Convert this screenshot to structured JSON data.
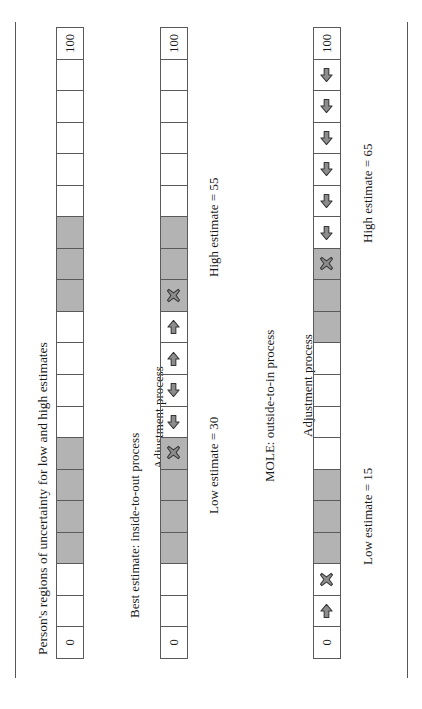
{
  "figure": {
    "title": "Person's regions of uncertainty for low and high estimates",
    "scale_min_label": "0",
    "scale_max_label": "100",
    "cell_count": 20,
    "shade_color": "#b3b3b3",
    "line_color": "#5a5a5a"
  },
  "panels": [
    {
      "id": "panel-uncertainty",
      "caption": "",
      "bar": {
        "name": "uncertainty-regions-bar",
        "min_label": "0",
        "max_label": "100",
        "cells": [
          {
            "index": 0,
            "value_range": "0-5",
            "shaded": false,
            "icon": null
          },
          {
            "index": 1,
            "value_range": "5-10",
            "shaded": false,
            "icon": null
          },
          {
            "index": 2,
            "value_range": "10-15",
            "shaded": false,
            "icon": null
          },
          {
            "index": 3,
            "value_range": "15-20",
            "shaded": true,
            "icon": null
          },
          {
            "index": 4,
            "value_range": "20-25",
            "shaded": true,
            "icon": null
          },
          {
            "index": 5,
            "value_range": "25-30",
            "shaded": true,
            "icon": null
          },
          {
            "index": 6,
            "value_range": "30-35",
            "shaded": true,
            "icon": null
          },
          {
            "index": 7,
            "value_range": "35-40",
            "shaded": false,
            "icon": null
          },
          {
            "index": 8,
            "value_range": "40-45",
            "shaded": false,
            "icon": null
          },
          {
            "index": 9,
            "value_range": "45-50",
            "shaded": false,
            "icon": null
          },
          {
            "index": 10,
            "value_range": "50-55",
            "shaded": false,
            "icon": null
          },
          {
            "index": 11,
            "value_range": "55-60",
            "shaded": true,
            "icon": null
          },
          {
            "index": 12,
            "value_range": "60-65",
            "shaded": true,
            "icon": null
          },
          {
            "index": 13,
            "value_range": "65-70",
            "shaded": true,
            "icon": null
          },
          {
            "index": 14,
            "value_range": "70-75",
            "shaded": false,
            "icon": null
          },
          {
            "index": 15,
            "value_range": "75-80",
            "shaded": false,
            "icon": null
          },
          {
            "index": 16,
            "value_range": "80-85",
            "shaded": false,
            "icon": null
          },
          {
            "index": 17,
            "value_range": "85-90",
            "shaded": false,
            "icon": null
          },
          {
            "index": 18,
            "value_range": "90-95",
            "shaded": false,
            "icon": null
          },
          {
            "index": 19,
            "value_range": "95-100",
            "shaded": false,
            "icon": null
          }
        ]
      },
      "labels": []
    },
    {
      "id": "panel-inside-to-out",
      "caption": "Best estimate: inside-to-out process",
      "process_label": "Adjustment process",
      "bar": {
        "name": "inside-to-out-bar",
        "min_label": "0",
        "max_label": "100",
        "cells": [
          {
            "index": 0,
            "value_range": "0-5",
            "shaded": false,
            "icon": null
          },
          {
            "index": 1,
            "value_range": "5-10",
            "shaded": false,
            "icon": null
          },
          {
            "index": 2,
            "value_range": "10-15",
            "shaded": false,
            "icon": null
          },
          {
            "index": 3,
            "value_range": "15-20",
            "shaded": true,
            "icon": null
          },
          {
            "index": 4,
            "value_range": "20-25",
            "shaded": true,
            "icon": null
          },
          {
            "index": 5,
            "value_range": "25-30",
            "shaded": true,
            "icon": null
          },
          {
            "index": 6,
            "value_range": "30-35",
            "shaded": true,
            "icon": "cross-marker-icon"
          },
          {
            "index": 7,
            "value_range": "35-40",
            "shaded": false,
            "icon": "arrow-down-icon"
          },
          {
            "index": 8,
            "value_range": "40-45",
            "shaded": false,
            "icon": "arrow-down-icon"
          },
          {
            "index": 9,
            "value_range": "45-50",
            "shaded": false,
            "icon": "arrow-up-icon"
          },
          {
            "index": 10,
            "value_range": "50-55",
            "shaded": false,
            "icon": "arrow-up-icon"
          },
          {
            "index": 11,
            "value_range": "55-60",
            "shaded": true,
            "icon": "cross-marker-icon"
          },
          {
            "index": 12,
            "value_range": "60-65",
            "shaded": true,
            "icon": null
          },
          {
            "index": 13,
            "value_range": "65-70",
            "shaded": true,
            "icon": null
          },
          {
            "index": 14,
            "value_range": "70-75",
            "shaded": false,
            "icon": null
          },
          {
            "index": 15,
            "value_range": "75-80",
            "shaded": false,
            "icon": null
          },
          {
            "index": 16,
            "value_range": "80-85",
            "shaded": false,
            "icon": null
          },
          {
            "index": 17,
            "value_range": "85-90",
            "shaded": false,
            "icon": null
          },
          {
            "index": 18,
            "value_range": "90-95",
            "shaded": false,
            "icon": null
          },
          {
            "index": 19,
            "value_range": "95-100",
            "shaded": false,
            "icon": null
          }
        ]
      },
      "low_estimate_label": "Low estimate = 30",
      "high_estimate_label": "High estimate = 55",
      "low_estimate_value": 30,
      "high_estimate_value": 55
    },
    {
      "id": "panel-outside-to-in",
      "caption": "MOLE: outside-to-in process",
      "process_label": "Adjustment process",
      "bar": {
        "name": "outside-to-in-bar",
        "min_label": "0",
        "max_label": "100",
        "cells": [
          {
            "index": 0,
            "value_range": "0-5",
            "shaded": false,
            "icon": "arrow-up-icon"
          },
          {
            "index": 1,
            "value_range": "5-10",
            "shaded": false,
            "icon": "arrow-up-icon"
          },
          {
            "index": 2,
            "value_range": "10-15",
            "shaded": false,
            "icon": "cross-marker-icon"
          },
          {
            "index": 3,
            "value_range": "15-20",
            "shaded": true,
            "icon": null
          },
          {
            "index": 4,
            "value_range": "20-25",
            "shaded": true,
            "icon": null
          },
          {
            "index": 5,
            "value_range": "25-30",
            "shaded": true,
            "icon": null
          },
          {
            "index": 6,
            "value_range": "30-35",
            "shaded": false,
            "icon": null
          },
          {
            "index": 7,
            "value_range": "35-40",
            "shaded": false,
            "icon": null
          },
          {
            "index": 8,
            "value_range": "40-45",
            "shaded": false,
            "icon": null
          },
          {
            "index": 9,
            "value_range": "45-50",
            "shaded": false,
            "icon": null
          },
          {
            "index": 10,
            "value_range": "50-55",
            "shaded": true,
            "icon": null
          },
          {
            "index": 11,
            "value_range": "55-60",
            "shaded": true,
            "icon": null
          },
          {
            "index": 12,
            "value_range": "60-65",
            "shaded": true,
            "icon": "cross-marker-icon"
          },
          {
            "index": 13,
            "value_range": "65-70",
            "shaded": false,
            "icon": "arrow-down-icon"
          },
          {
            "index": 14,
            "value_range": "70-75",
            "shaded": false,
            "icon": "arrow-down-icon"
          },
          {
            "index": 15,
            "value_range": "75-80",
            "shaded": false,
            "icon": "arrow-down-icon"
          },
          {
            "index": 16,
            "value_range": "80-85",
            "shaded": false,
            "icon": "arrow-down-icon"
          },
          {
            "index": 17,
            "value_range": "85-90",
            "shaded": false,
            "icon": "arrow-down-icon"
          },
          {
            "index": 18,
            "value_range": "90-95",
            "shaded": false,
            "icon": "arrow-down-icon"
          },
          {
            "index": 19,
            "value_range": "95-100",
            "shaded": false,
            "icon": null
          }
        ]
      },
      "low_estimate_label": "Low estimate = 15",
      "high_estimate_label": "High estimate = 65",
      "low_estimate_value": 15,
      "high_estimate_value": 65
    }
  ]
}
